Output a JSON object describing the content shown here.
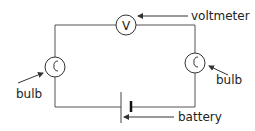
{
  "diagram": {
    "type": "circuit",
    "components": [
      {
        "id": "voltmeter",
        "symbol": "V",
        "label": "voltmeter"
      },
      {
        "id": "bulb-left",
        "label": "bulb"
      },
      {
        "id": "bulb-right",
        "label": "bulb"
      },
      {
        "id": "battery",
        "label": "battery"
      }
    ],
    "labels": {
      "voltmeter": "voltmeter",
      "voltmeter_symbol": "V",
      "bulb_left": "bulb",
      "bulb_right": "bulb",
      "battery": "battery"
    },
    "colors": {
      "wire": "#555555",
      "text": "#222222",
      "background": "#ffffff"
    }
  }
}
